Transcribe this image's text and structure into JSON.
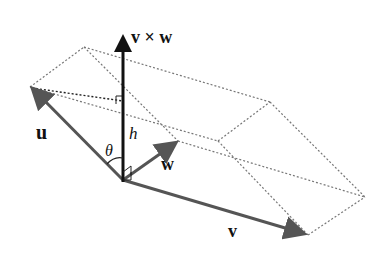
{
  "diagram": {
    "labels": {
      "cross": "v × w",
      "u": "u",
      "v": "v",
      "w": "w",
      "h": "h",
      "theta": "θ"
    },
    "colors": {
      "vector_gray": "#555555",
      "cross_black": "#111111",
      "dashed": "#777777",
      "background": "#ffffff"
    }
  }
}
